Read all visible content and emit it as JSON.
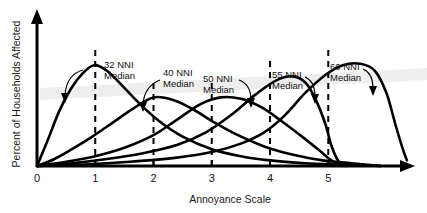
{
  "chart_data": {
    "type": "line",
    "title": "",
    "xlabel": "Annoyance Scale",
    "ylabel": "Percent of Households Affected",
    "xlim": [
      0,
      6.3
    ],
    "ylim": [
      0,
      100
    ],
    "xticks": [
      "0",
      "1",
      "2",
      "3",
      "4",
      "5"
    ],
    "xtick_values": [
      0,
      1,
      2,
      3,
      4,
      5
    ],
    "grid": false,
    "legend": "none",
    "annotations": [
      {
        "label_line1": "32 NNI",
        "label_line2": "Median",
        "median_x": 1.0,
        "arrow": "down-left"
      },
      {
        "label_line1": "40 NNI",
        "label_line2": "Median",
        "median_x": 2.0,
        "arrow": "down-left"
      },
      {
        "label_line1": "50 NNI",
        "label_line2": "Median",
        "median_x": 3.0,
        "arrow": "down-right"
      },
      {
        "label_line1": "55 NNI",
        "label_line2": "Median",
        "median_x": 4.0,
        "arrow": "down-right"
      },
      {
        "label_line1": "60 NNI",
        "label_line2": "Median",
        "median_x": 5.0,
        "arrow": "down-right"
      }
    ],
    "series": [
      {
        "name": "32 NNI",
        "median_x": 1.0,
        "peak_x": 1.0,
        "peak_y": 72,
        "points": [
          [
            0,
            0
          ],
          [
            0.18,
            18
          ],
          [
            0.38,
            39
          ],
          [
            0.58,
            55
          ],
          [
            0.78,
            66
          ],
          [
            0.98,
            72
          ],
          [
            1.2,
            68
          ],
          [
            1.45,
            58
          ],
          [
            1.75,
            45
          ],
          [
            2.1,
            32
          ],
          [
            2.5,
            21
          ],
          [
            3.0,
            12
          ],
          [
            3.5,
            7
          ],
          [
            4.0,
            4
          ],
          [
            4.6,
            2
          ],
          [
            5.2,
            1
          ],
          [
            5.9,
            0
          ]
        ]
      },
      {
        "name": "40 NNI",
        "median_x": 2.0,
        "peak_x": 2.05,
        "peak_y": 50,
        "points": [
          [
            0,
            0
          ],
          [
            0.3,
            5
          ],
          [
            0.6,
            12
          ],
          [
            0.95,
            21
          ],
          [
            1.3,
            31
          ],
          [
            1.65,
            41
          ],
          [
            2.0,
            49
          ],
          [
            2.35,
            47
          ],
          [
            2.7,
            40
          ],
          [
            3.05,
            31
          ],
          [
            3.45,
            22
          ],
          [
            3.9,
            14
          ],
          [
            4.4,
            8
          ],
          [
            4.9,
            4
          ],
          [
            5.4,
            2
          ],
          [
            5.9,
            0
          ]
        ]
      },
      {
        "name": "50 NNI",
        "median_x": 3.0,
        "peak_x": 3.25,
        "peak_y": 49,
        "points": [
          [
            0,
            0
          ],
          [
            0.5,
            3
          ],
          [
            1.0,
            7
          ],
          [
            1.5,
            13
          ],
          [
            2.0,
            22
          ],
          [
            2.4,
            33
          ],
          [
            2.8,
            44
          ],
          [
            3.15,
            49
          ],
          [
            3.5,
            48
          ],
          [
            3.85,
            42
          ],
          [
            4.2,
            32
          ],
          [
            4.55,
            21
          ],
          [
            4.85,
            11
          ],
          [
            5.05,
            4
          ],
          [
            5.2,
            1
          ],
          [
            5.3,
            0
          ]
        ]
      },
      {
        "name": "55 NNI",
        "median_x": 4.0,
        "peak_x": 4.4,
        "peak_y": 64,
        "points": [
          [
            0,
            0
          ],
          [
            0.6,
            2
          ],
          [
            1.2,
            5
          ],
          [
            1.8,
            9
          ],
          [
            2.4,
            15
          ],
          [
            2.9,
            24
          ],
          [
            3.35,
            37
          ],
          [
            3.75,
            51
          ],
          [
            4.1,
            61
          ],
          [
            4.4,
            64
          ],
          [
            4.62,
            59
          ],
          [
            4.8,
            46
          ],
          [
            4.95,
            30
          ],
          [
            5.05,
            15
          ],
          [
            5.15,
            5
          ],
          [
            5.25,
            0
          ]
        ]
      },
      {
        "name": "60 NNI",
        "median_x": 5.0,
        "peak_x": 5.45,
        "peak_y": 72,
        "points": [
          [
            0,
            0
          ],
          [
            0.8,
            1
          ],
          [
            1.6,
            3
          ],
          [
            2.4,
            6
          ],
          [
            3.0,
            10
          ],
          [
            3.5,
            16
          ],
          [
            3.9,
            24
          ],
          [
            4.25,
            36
          ],
          [
            4.6,
            52
          ],
          [
            4.95,
            65
          ],
          [
            5.25,
            72
          ],
          [
            5.55,
            73
          ],
          [
            5.8,
            68
          ],
          [
            6.0,
            52
          ],
          [
            6.15,
            30
          ],
          [
            6.28,
            12
          ],
          [
            6.35,
            4
          ]
        ]
      }
    ]
  }
}
